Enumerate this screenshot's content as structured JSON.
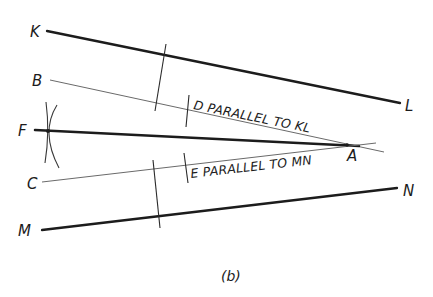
{
  "diagram": {
    "caption": "(b)",
    "points": {
      "K": "K",
      "L": "L",
      "B": "B",
      "F": "F",
      "C": "C",
      "M": "M",
      "N": "N",
      "A": "A"
    },
    "annotations": {
      "d_note": "D PARALLEL TO KL",
      "e_note": "E PARALLEL TO MN"
    },
    "lines": [
      {
        "name": "KL",
        "from": [
          47,
          31
        ],
        "to": [
          400,
          103
        ],
        "weight": "heavy"
      },
      {
        "name": "B-line",
        "from": [
          50,
          80
        ],
        "to": [
          384,
          152
        ],
        "weight": "light"
      },
      {
        "name": "FA",
        "from": [
          35,
          130
        ],
        "to": [
          359,
          146
        ],
        "weight": "heavy"
      },
      {
        "name": "C-line",
        "from": [
          42,
          182
        ],
        "to": [
          376,
          143
        ],
        "weight": "light"
      },
      {
        "name": "MN",
        "from": [
          42,
          230
        ],
        "to": [
          397,
          188
        ],
        "weight": "heavy"
      }
    ],
    "colors": {
      "ink": "#1c1c1c",
      "light_ink": "#6a6a6a",
      "background": "#ffffff"
    }
  }
}
